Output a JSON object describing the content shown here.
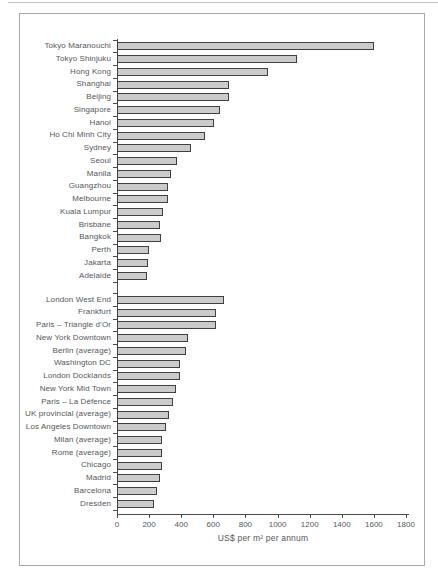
{
  "chart_data": {
    "type": "bar",
    "orientation": "horizontal",
    "title": "",
    "xlabel": "US$ per m² per annum",
    "ylabel": "",
    "xlim": [
      0,
      1800
    ],
    "x_ticks": [
      0,
      200,
      400,
      600,
      800,
      1000,
      1200,
      1400,
      1600,
      1800
    ],
    "grid": false,
    "legend": false,
    "bar_color": "#cbcbcb",
    "bar_border_color": "#3f3f3f",
    "axis_color": "#4a4a4a",
    "groups": [
      {
        "categories": [
          "Tokyo Maranouchi",
          "Tokyo Shinjuku",
          "Hong Kong",
          "Shanghai",
          "Beijing",
          "Singapore",
          "Hanoi",
          "Ho Chi Minh City",
          "Sydney",
          "Seoul",
          "Manila",
          "Guangzhou",
          "Melbourne",
          "Kuala Lumpur",
          "Brisbane",
          "Bangkok",
          "Perth",
          "Jakarta",
          "Adelaide"
        ],
        "values": [
          1600,
          1120,
          940,
          700,
          700,
          640,
          605,
          550,
          460,
          375,
          335,
          320,
          315,
          285,
          270,
          275,
          200,
          190,
          185
        ]
      },
      {
        "categories": [
          "London West End",
          "Frankfurt",
          "Paris – Triangle d’Or",
          "New York Downtown",
          "Berlin (average)",
          "Washington DC",
          "London Docklands",
          "New York Mid Town",
          "Paris – La Défence",
          "UK provincial (average)",
          "Los Angeles Downtown",
          "Milan (average)",
          "Rome (average)",
          "Chicago",
          "Madrid",
          "Barcelona",
          "Dresden"
        ],
        "values": [
          665,
          615,
          615,
          445,
          430,
          395,
          395,
          370,
          350,
          325,
          305,
          280,
          280,
          280,
          270,
          250,
          230
        ]
      }
    ]
  }
}
